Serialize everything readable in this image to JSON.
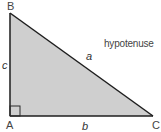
{
  "diagram": {
    "type": "right-triangle",
    "fill_color": "#cfcfcf",
    "stroke_color": "#1e1e1e",
    "vertices": [
      {
        "id": "B",
        "label": "B"
      },
      {
        "id": "A",
        "label": "A"
      },
      {
        "id": "C",
        "label": "C"
      }
    ],
    "sides": {
      "a": "a",
      "b": "b",
      "c": "c"
    },
    "annotation": "hypotenuse",
    "right_angle_at": "A"
  }
}
